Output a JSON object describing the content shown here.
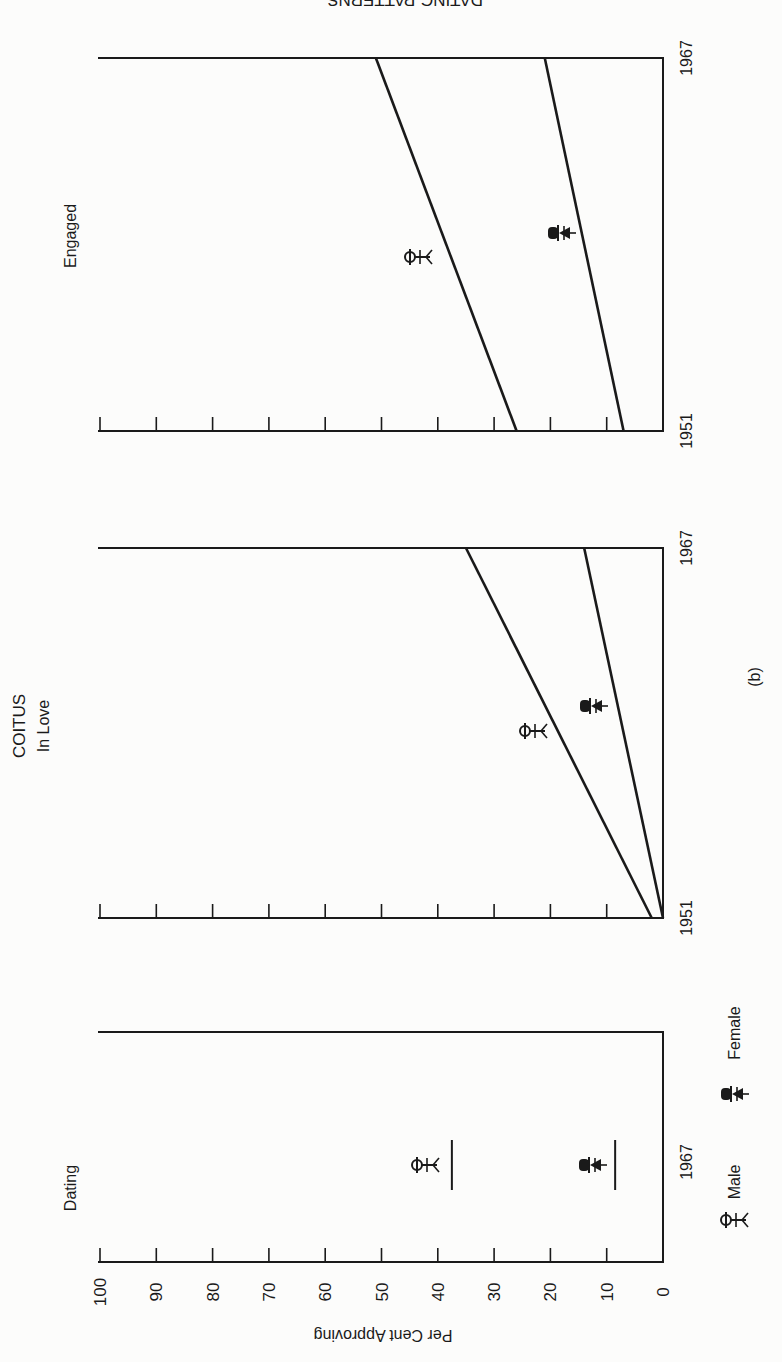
{
  "page": {
    "running_header": "DATING PATTERNS",
    "figure_label": "(b)",
    "title": "COITUS"
  },
  "axis": {
    "label": "Per Cent Approving",
    "ticks": [
      "100",
      "90",
      "80",
      "70",
      "60",
      "50",
      "40",
      "30",
      "20",
      "10",
      "0"
    ]
  },
  "legend": {
    "male_label": "Male",
    "female_label": "Female",
    "male_icon": "male-figure-icon",
    "female_icon": "female-figure-icon"
  },
  "panels": [
    {
      "name": "Dating",
      "year_start": "",
      "year_end": "1967"
    },
    {
      "name": "In Love",
      "year_start": "1951",
      "year_end": "1967"
    },
    {
      "name": "Engaged",
      "year_start": "1951",
      "year_end": "1967"
    }
  ],
  "chart_data": {
    "type": "line",
    "title": "COITUS",
    "subtitle": "(b)",
    "xlabel": "Year",
    "ylabel": "Per Cent Approving",
    "ylim": [
      0,
      100
    ],
    "orientation": "rotated 90 degrees (page turned sideways)",
    "grid": false,
    "legend_position": "bottom",
    "x": [
      "1951",
      "1967"
    ],
    "panels": [
      {
        "name": "Dating",
        "x": [
          "1967"
        ],
        "series": [
          {
            "name": "Male",
            "values": [
              37.5
            ]
          },
          {
            "name": "Female",
            "values": [
              8.5
            ]
          }
        ]
      },
      {
        "name": "In Love",
        "x": [
          "1951",
          "1967"
        ],
        "series": [
          {
            "name": "Male",
            "values": [
              2,
              35
            ]
          },
          {
            "name": "Female",
            "values": [
              0,
              14
            ]
          }
        ]
      },
      {
        "name": "Engaged",
        "x": [
          "1951",
          "1967"
        ],
        "series": [
          {
            "name": "Male",
            "values": [
              26,
              51
            ]
          },
          {
            "name": "Female",
            "values": [
              7,
              21
            ]
          }
        ]
      }
    ]
  }
}
